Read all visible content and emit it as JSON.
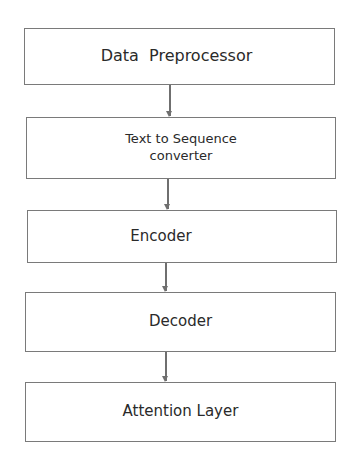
{
  "diagram": {
    "type": "flowchart",
    "direction": "top-to-bottom",
    "colors": {
      "background": "#ffffff",
      "border": "#7a7a7a",
      "arrow": "#6f6f6f",
      "text": "#2a2a2a"
    },
    "nodes": [
      {
        "id": "data-preprocessor",
        "label": "Data  Preprocessor"
      },
      {
        "id": "text-to-sequence-converter",
        "label": "Text to Sequence\nconverter"
      },
      {
        "id": "encoder",
        "label": "Encoder"
      },
      {
        "id": "decoder",
        "label": "Decoder"
      },
      {
        "id": "attention-layer",
        "label": "Attention Layer"
      }
    ],
    "edges": [
      {
        "from": "data-preprocessor",
        "to": "text-to-sequence-converter"
      },
      {
        "from": "text-to-sequence-converter",
        "to": "encoder"
      },
      {
        "from": "encoder",
        "to": "decoder"
      },
      {
        "from": "decoder",
        "to": "attention-layer"
      }
    ]
  }
}
